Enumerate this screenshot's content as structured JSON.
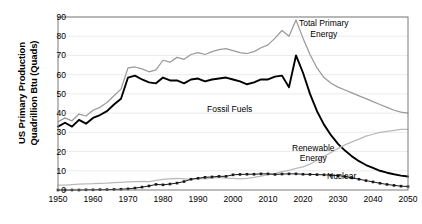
{
  "chart_data": {
    "type": "line",
    "title": "",
    "xlabel": "",
    "ylabel": "US Primary Production Quadrillion Btu (Quads)",
    "ylabel_lines": [
      "US Primary Production",
      "Quadrillion Btu (Quads)"
    ],
    "xlim": [
      1950,
      2050
    ],
    "ylim": [
      0,
      90
    ],
    "ytick_values": [
      0,
      10,
      20,
      30,
      40,
      50,
      60,
      70,
      80,
      90
    ],
    "xtick_values": [
      1950,
      1960,
      1970,
      1980,
      1990,
      2000,
      2010,
      2020,
      2030,
      2040,
      2050
    ],
    "grid": "horizontal",
    "legend_position": "inline-annotations",
    "colors": {
      "total_primary_energy": "#9a9a9a",
      "fossil_fuels": "#000000",
      "renewable_energy": "#b9b9b9",
      "nuclear": "#1a1a1a",
      "axis": "#7a7a7a",
      "gridline": "#ececec",
      "background": "#ffffff"
    },
    "annotations": [
      {
        "name": "total-primary-energy-label",
        "lines": [
          "Total Primary",
          "Energy"
        ],
        "x": 2026,
        "y": 84
      },
      {
        "name": "fossil-fuels-label",
        "lines": [
          "Fossil Fuels"
        ],
        "x": 1999,
        "y": 42
      },
      {
        "name": "renewable-energy-label",
        "lines": [
          "Renewable",
          "Energy"
        ],
        "x": 2023,
        "y": 19
      },
      {
        "name": "nuclear-label",
        "lines": [
          "Nuclear"
        ],
        "x": 2031,
        "y": 7
      }
    ],
    "x": [
      1950,
      1952,
      1954,
      1956,
      1958,
      1960,
      1962,
      1964,
      1966,
      1968,
      1970,
      1972,
      1974,
      1976,
      1978,
      1980,
      1982,
      1984,
      1986,
      1988,
      1990,
      1992,
      1994,
      1996,
      1998,
      2000,
      2002,
      2004,
      2006,
      2008,
      2010,
      2012,
      2014,
      2016,
      2018,
      2020,
      2022,
      2024,
      2026,
      2028,
      2030,
      2032,
      2034,
      2036,
      2038,
      2040,
      2042,
      2044,
      2046,
      2048,
      2050
    ],
    "series": [
      {
        "name": "Total Primary Energy",
        "color": "#9a9a9a",
        "style": "solid",
        "values": [
          35.5,
          37.5,
          36.0,
          39.5,
          38.5,
          41.5,
          43.0,
          45.5,
          49.0,
          52.5,
          63.5,
          64.0,
          63.0,
          61.5,
          62.5,
          67.5,
          66.5,
          69.0,
          68.0,
          70.5,
          71.5,
          70.5,
          72.0,
          73.0,
          73.5,
          72.5,
          71.5,
          71.0,
          72.0,
          74.0,
          75.5,
          79.0,
          83.0,
          80.0,
          88.5,
          79.0,
          70.5,
          63.5,
          58.5,
          55.5,
          53.5,
          52.0,
          50.5,
          49.0,
          47.5,
          46.0,
          44.5,
          43.0,
          41.5,
          40.5,
          40.0
        ]
      },
      {
        "name": "Fossil Fuels",
        "color": "#000000",
        "style": "solid",
        "values": [
          33.0,
          35.0,
          33.0,
          36.5,
          34.5,
          37.5,
          39.0,
          41.0,
          44.5,
          47.5,
          58.5,
          59.5,
          57.5,
          56.0,
          55.5,
          58.5,
          57.0,
          57.0,
          55.5,
          57.5,
          58.0,
          56.5,
          57.5,
          58.0,
          58.5,
          57.5,
          56.5,
          55.0,
          56.0,
          57.5,
          57.5,
          59.0,
          59.5,
          53.5,
          70.0,
          61.0,
          50.0,
          41.0,
          34.0,
          28.5,
          24.0,
          20.5,
          17.5,
          15.0,
          13.0,
          11.5,
          10.0,
          9.0,
          8.2,
          7.5,
          7.0
        ]
      },
      {
        "name": "Renewable Energy",
        "color": "#b9b9b9",
        "style": "solid",
        "values": [
          2.5,
          2.5,
          2.8,
          3.0,
          3.2,
          3.3,
          3.5,
          3.6,
          3.8,
          4.0,
          4.2,
          4.4,
          4.5,
          4.3,
          5.0,
          5.5,
          5.8,
          6.0,
          5.8,
          5.5,
          6.0,
          5.8,
          6.2,
          6.6,
          6.2,
          6.1,
          5.8,
          6.1,
          6.6,
          7.2,
          8.0,
          8.5,
          9.6,
          10.2,
          11.3,
          12.0,
          13.5,
          15.5,
          17.5,
          19.5,
          21.5,
          23.5,
          25.0,
          26.5,
          28.0,
          29.0,
          30.0,
          30.5,
          31.0,
          31.5,
          31.5
        ]
      },
      {
        "name": "Nuclear",
        "color": "#1a1a1a",
        "style": "markers",
        "values": [
          0.0,
          0.0,
          0.0,
          0.0,
          0.1,
          0.1,
          0.2,
          0.2,
          0.3,
          0.4,
          0.6,
          1.0,
          1.5,
          2.1,
          2.9,
          2.7,
          3.1,
          3.6,
          4.4,
          5.6,
          6.1,
          6.6,
          6.8,
          7.1,
          7.1,
          7.9,
          8.1,
          8.2,
          8.2,
          8.4,
          8.4,
          8.1,
          8.3,
          8.4,
          8.4,
          8.2,
          8.1,
          8.0,
          7.9,
          7.7,
          7.5,
          7.0,
          6.3,
          5.6,
          4.9,
          4.2,
          3.5,
          2.9,
          2.4,
          2.0,
          1.8
        ]
      }
    ]
  }
}
